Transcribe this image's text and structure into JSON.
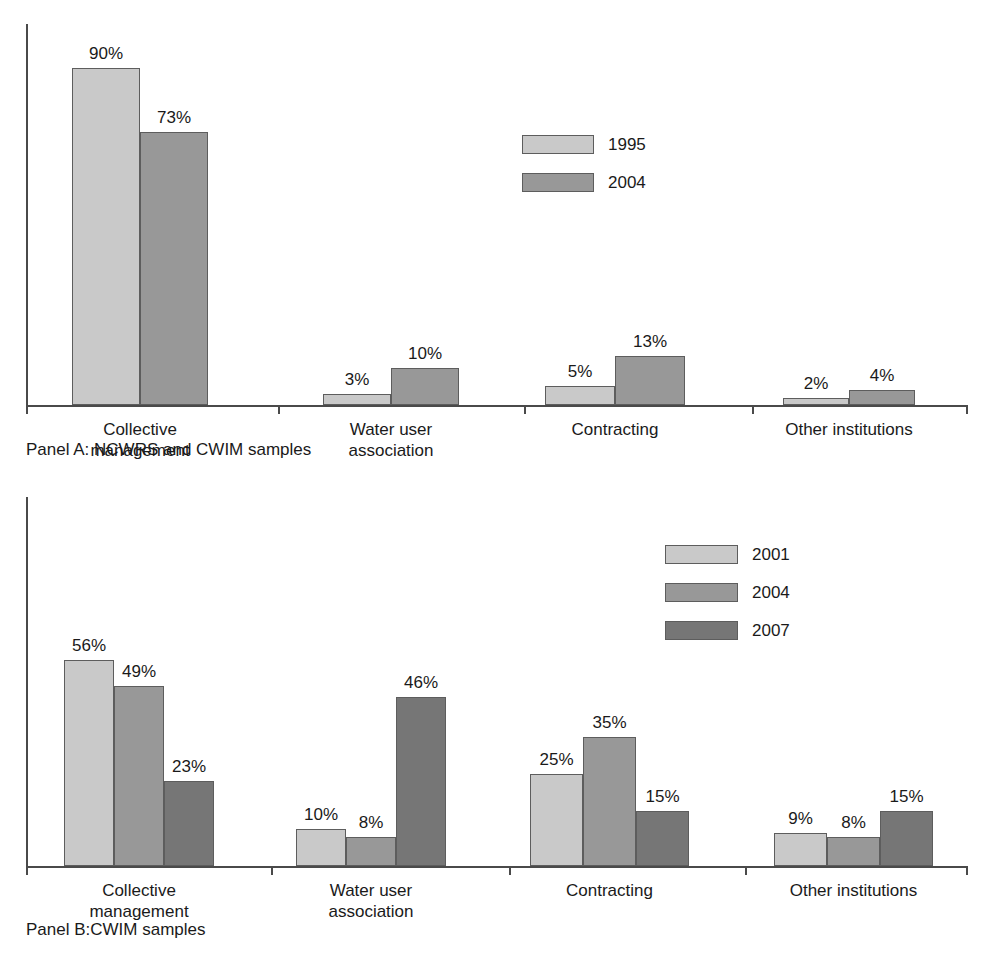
{
  "figure": {
    "background": "#ffffff",
    "series_colors": {
      "light": "#c9c9c9",
      "medium": "#989898",
      "dark": "#767676"
    },
    "axis_color": "#4a4a4a"
  },
  "panel_a": {
    "caption": "Panel A: NCWRS and CWIM samples",
    "legend": {
      "entries": [
        {
          "label": "1995",
          "color": "#c9c9c9"
        },
        {
          "label": "2004",
          "color": "#989898"
        }
      ]
    }
  },
  "panel_b": {
    "caption": "Panel B:CWIM samples",
    "legend": {
      "entries": [
        {
          "label": "2001",
          "color": "#c9c9c9"
        },
        {
          "label": "2004",
          "color": "#989898"
        },
        {
          "label": "2007",
          "color": "#767676"
        }
      ]
    }
  },
  "chart_data": [
    {
      "type": "bar",
      "title": "Panel A: NCWRS and CWIM samples",
      "xlabel": "",
      "ylabel": "",
      "ylim": [
        0,
        100
      ],
      "grid": false,
      "legend_position": "upper-center-right",
      "categories": [
        "Collective management",
        "Water user association",
        "Contracting",
        "Other institutions"
      ],
      "category_lines": [
        [
          "Collective",
          "management"
        ],
        [
          "Water user",
          "association"
        ],
        [
          "Contracting"
        ],
        [
          "Other institutions"
        ]
      ],
      "series": [
        {
          "name": "1995",
          "color": "#c9c9c9",
          "values": [
            90,
            3,
            5,
            2
          ],
          "labels": [
            "90%",
            "3%",
            "5%",
            "2%"
          ]
        },
        {
          "name": "2004",
          "color": "#989898",
          "values": [
            73,
            10,
            13,
            4
          ],
          "labels": [
            "73%",
            "10%",
            "13%",
            "4%"
          ]
        }
      ]
    },
    {
      "type": "bar",
      "title": "Panel B:CWIM samples",
      "xlabel": "",
      "ylabel": "",
      "ylim": [
        0,
        100
      ],
      "grid": false,
      "legend_position": "upper-center-right",
      "categories": [
        "Collective management",
        "Water user association",
        "Contracting",
        "Other institutions"
      ],
      "category_lines": [
        [
          "Collective",
          "management"
        ],
        [
          "Water user",
          "association"
        ],
        [
          "Contracting"
        ],
        [
          "Other institutions"
        ]
      ],
      "series": [
        {
          "name": "2001",
          "color": "#c9c9c9",
          "values": [
            56,
            10,
            25,
            9
          ],
          "labels": [
            "56%",
            "10%",
            "25%",
            "9%"
          ]
        },
        {
          "name": "2004",
          "color": "#989898",
          "values": [
            49,
            8,
            35,
            8
          ],
          "labels": [
            "49%",
            "8%",
            "35%",
            "8%"
          ]
        },
        {
          "name": "2007",
          "color": "#767676",
          "values": [
            23,
            46,
            15,
            15
          ],
          "labels": [
            "23%",
            "46%",
            "15%",
            "15%"
          ]
        }
      ]
    }
  ]
}
